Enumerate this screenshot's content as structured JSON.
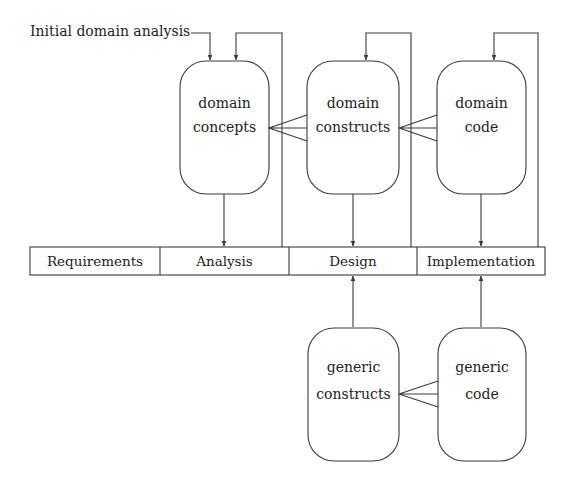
{
  "diagram": {
    "input_label": "Initial domain analysis",
    "domain_boxes": [
      {
        "id": "domain-concepts",
        "line1": "domain",
        "line2": "concepts"
      },
      {
        "id": "domain-constructs",
        "line1": "domain",
        "line2": "constructs"
      },
      {
        "id": "domain-code",
        "line1": "domain",
        "line2": "code"
      }
    ],
    "generic_boxes": [
      {
        "id": "generic-constructs",
        "line1": "generic",
        "line2": "constructs"
      },
      {
        "id": "generic-code",
        "line1": "generic",
        "line2": "code"
      }
    ],
    "phases": [
      "Requirements",
      "Analysis",
      "Design",
      "Implementation"
    ],
    "colors": {
      "stroke": "#3a3a3a",
      "text": "#222222",
      "background": "#ffffff"
    }
  }
}
